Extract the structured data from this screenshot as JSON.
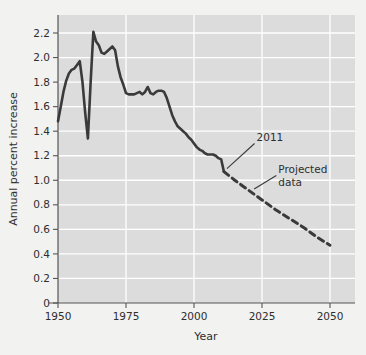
{
  "chart_data": {
    "type": "line",
    "title": "",
    "xlabel": "Year",
    "ylabel": "Annual percent increase",
    "xlim": [
      1950,
      2050
    ],
    "ylim": [
      0,
      2.3
    ],
    "grid": true,
    "legend_position": "none",
    "xticks": [
      "1950",
      "1975",
      "2000",
      "2025",
      "2050"
    ],
    "xtick_values": [
      1950,
      1975,
      2000,
      2025,
      2050
    ],
    "yticks": [
      "0",
      "0.2",
      "0.4",
      "0.6",
      "0.8",
      "1.0",
      "1.2",
      "1.4",
      "1.6",
      "1.8",
      "2.0",
      "2.2"
    ],
    "ytick_values": [
      0,
      0.2,
      0.4,
      0.6,
      0.8,
      1.0,
      1.2,
      1.4,
      1.6,
      1.8,
      2.0,
      2.2
    ],
    "annotations": [
      {
        "text": "2011",
        "x": 2023,
        "y": 1.32,
        "points_to_x": 2011,
        "points_to_y": 1.07
      },
      {
        "text": "Projected",
        "x": 2031,
        "y": 1.06,
        "points_to_x": 2021,
        "points_to_y": 0.905
      },
      {
        "text": "data",
        "x": 2031,
        "y": 0.955,
        "points_to_x": null,
        "points_to_y": null
      }
    ],
    "series": [
      {
        "name": "Observed",
        "style": "solid",
        "color": "#3a3a3a",
        "x": [
          1950,
          1951,
          1952,
          1953,
          1954,
          1955,
          1956,
          1957,
          1958,
          1959,
          1960,
          1961,
          1962,
          1963,
          1964,
          1965,
          1966,
          1967,
          1968,
          1969,
          1970,
          1971,
          1972,
          1973,
          1974,
          1975,
          1976,
          1977,
          1978,
          1979,
          1980,
          1981,
          1982,
          1983,
          1984,
          1985,
          1986,
          1987,
          1988,
          1989,
          1990,
          1991,
          1992,
          1993,
          1994,
          1995,
          1996,
          1997,
          1998,
          1999,
          2000,
          2001,
          2002,
          2003,
          2004,
          2005,
          2006,
          2007,
          2008,
          2009,
          2010,
          2011
        ],
        "values": [
          1.48,
          1.6,
          1.72,
          1.81,
          1.87,
          1.9,
          1.91,
          1.94,
          1.97,
          1.8,
          1.55,
          1.34,
          1.8,
          2.21,
          2.13,
          2.1,
          2.04,
          2.03,
          2.05,
          2.07,
          2.09,
          2.06,
          1.93,
          1.84,
          1.78,
          1.71,
          1.7,
          1.7,
          1.7,
          1.71,
          1.72,
          1.7,
          1.72,
          1.76,
          1.71,
          1.7,
          1.72,
          1.73,
          1.73,
          1.72,
          1.67,
          1.6,
          1.53,
          1.48,
          1.44,
          1.42,
          1.4,
          1.38,
          1.35,
          1.33,
          1.3,
          1.27,
          1.25,
          1.24,
          1.22,
          1.21,
          1.21,
          1.21,
          1.2,
          1.18,
          1.17,
          1.07
        ]
      },
      {
        "name": "Projected data",
        "style": "dashed",
        "color": "#3a3a3a",
        "x": [
          2011,
          2015,
          2020,
          2025,
          2030,
          2035,
          2040,
          2045,
          2050
        ],
        "values": [
          1.07,
          1.0,
          0.92,
          0.84,
          0.76,
          0.69,
          0.62,
          0.54,
          0.47
        ]
      }
    ]
  },
  "axis": {
    "x_title": "Year",
    "y_title": "Annual percent increase"
  }
}
